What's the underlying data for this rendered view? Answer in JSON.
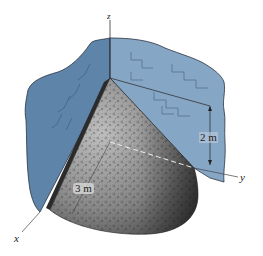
{
  "figure": {
    "axes": {
      "x": "x",
      "y": "y",
      "z": "z"
    },
    "dimensions": {
      "height": "2 m",
      "radius": "3 m"
    },
    "colors": {
      "wall_left": "#5f84aa",
      "wall_right": "#86a6c6",
      "wall_outline": "#2a3440",
      "cone_light": "#b9b9b9",
      "cone_dark": "#3a3a3a",
      "axis": "#333333"
    }
  }
}
